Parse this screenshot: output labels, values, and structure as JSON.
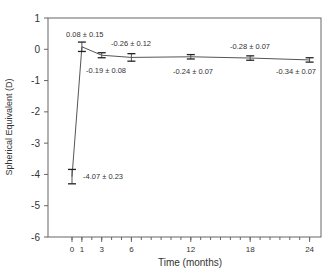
{
  "chart_data": {
    "type": "line",
    "title": "",
    "xlabel": "Time (months)",
    "ylabel": "Spherical Equivalent (D)",
    "xlim": [
      -1.5,
      25
    ],
    "ylim": [
      -6,
      1
    ],
    "x_ticks": [
      0,
      1,
      3,
      6,
      12,
      18,
      24
    ],
    "y_ticks": [
      1,
      0,
      -1,
      -2,
      -3,
      -4,
      -5,
      -6
    ],
    "grid": false,
    "series": [
      {
        "name": "Spherical Equivalent",
        "x": [
          0,
          1,
          3,
          6,
          12,
          18,
          24
        ],
        "values": [
          -4.07,
          0.08,
          -0.19,
          -0.26,
          -0.24,
          -0.28,
          -0.34
        ],
        "errors": [
          0.23,
          0.15,
          0.08,
          0.12,
          0.07,
          0.07,
          0.07
        ]
      }
    ],
    "annotations": [
      "-4.07 ± 0.23",
      "0.08 ± 0.15",
      "-0.19 ± 0.08",
      "-0.26 ± 0.12",
      "-0.24 ± 0.07",
      "-0.28 ± 0.07",
      "-0.34 ± 0.07"
    ]
  },
  "colors": {
    "line": "#555555",
    "axis": "#666666",
    "text": "#333333"
  }
}
